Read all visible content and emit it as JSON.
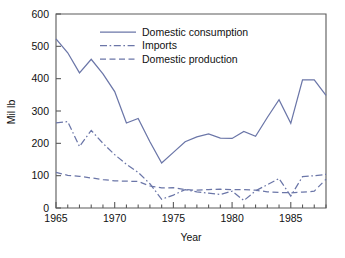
{
  "chart_data": {
    "type": "line",
    "title": "",
    "xlabel": "Year",
    "ylabel": "Mil lb",
    "xlim": [
      1965,
      1988
    ],
    "ylim": [
      0,
      600
    ],
    "grid": false,
    "legend_position": "top-center",
    "y_ticks": [
      0,
      100,
      200,
      300,
      400,
      500,
      600
    ],
    "y_tick_labels": [
      "0",
      "100",
      "200",
      "300",
      "400",
      "500",
      "600"
    ],
    "x_ticks": [
      1965,
      1970,
      1975,
      1980,
      1985
    ],
    "x_tick_labels": [
      "1965",
      "1970",
      "1975",
      "1980",
      "1985"
    ],
    "x_minor_ticks": [
      1966,
      1967,
      1968,
      1969,
      1971,
      1972,
      1973,
      1974,
      1976,
      1977,
      1978,
      1979,
      1981,
      1982,
      1983,
      1984,
      1986,
      1987,
      1988
    ],
    "x": [
      1965,
      1966,
      1967,
      1968,
      1969,
      1970,
      1971,
      1972,
      1973,
      1974,
      1975,
      1976,
      1977,
      1978,
      1979,
      1980,
      1981,
      1982,
      1983,
      1984,
      1985,
      1986,
      1987,
      1988
    ],
    "series": [
      {
        "name": "Domestic consumption",
        "style": "solid",
        "color": "#6b76a8",
        "values": [
          523,
          480,
          418,
          460,
          415,
          360,
          263,
          277,
          205,
          139,
          172,
          205,
          220,
          229,
          216,
          215,
          237,
          222,
          280,
          335,
          262,
          396,
          396,
          348
        ]
      },
      {
        "name": "Imports",
        "style": "dashdot",
        "color": "#6b76a8",
        "values": [
          263,
          267,
          190,
          240,
          200,
          165,
          135,
          110,
          75,
          27,
          40,
          57,
          50,
          46,
          42,
          52,
          23,
          53,
          72,
          91,
          37,
          97,
          100,
          104
        ]
      },
      {
        "name": "Domestic production",
        "style": "dashed",
        "color": "#6b76a8",
        "values": [
          110,
          101,
          98,
          93,
          88,
          84,
          83,
          82,
          68,
          62,
          63,
          57,
          55,
          57,
          58,
          57,
          57,
          55,
          50,
          48,
          47,
          49,
          52,
          89
        ]
      }
    ]
  },
  "legend": {
    "items": [
      {
        "label": "Domestic consumption"
      },
      {
        "label": "Imports"
      },
      {
        "label": "Domestic production"
      }
    ]
  },
  "axes": {
    "x_title": "Year",
    "y_title": "Mil lb"
  }
}
